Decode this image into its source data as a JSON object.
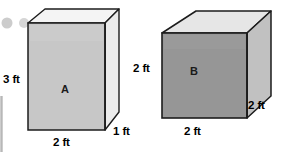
{
  "figure": {
    "unit": "ft",
    "background_color": "#ffffff",
    "outline_color": "#1c1c1c",
    "text_color": "#000000"
  },
  "decorations": {
    "dots": [
      {
        "name": "dot-left",
        "color": "#cccccc"
      },
      {
        "name": "dot-right",
        "color": "#d6d6d6"
      }
    ],
    "edge_rule": {
      "name": "left-edge-rule",
      "color": "#b8b8b8"
    }
  },
  "shapes": [
    {
      "id": "box-a",
      "name": "A",
      "label": "A",
      "type": "rectangular-prism",
      "dimensions": {
        "height": "3 ft",
        "width": "2 ft",
        "depth": "1 ft"
      },
      "height_value": 3,
      "width_value": 2,
      "depth_value": 1,
      "volume": "6 cubic ft",
      "colors": {
        "front_face": "#c7c7c7",
        "side_face": "#e9e9e9",
        "top_face": "#f2f2f2",
        "outline": "#1c1c1c"
      }
    },
    {
      "id": "box-b",
      "name": "B",
      "label": "B",
      "type": "rectangular-prism",
      "dimensions": {
        "height": "2 ft",
        "width": "2 ft",
        "depth": "2 ft"
      },
      "height_value": 2,
      "width_value": 2,
      "depth_value": 2,
      "volume": "8 cubic ft",
      "colors": {
        "front_face": "#969696",
        "side_face": "#c0c0c0",
        "top_face": "#e4e4e4",
        "outline": "#1c1c1c"
      }
    }
  ]
}
